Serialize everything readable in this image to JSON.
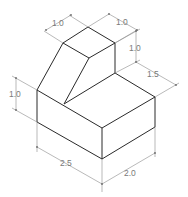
{
  "drawing": {
    "type": "isometric-dimensioned-part",
    "line_color": "#2a2a2a",
    "dimension_color": "#8a8a8a",
    "dimensions": [
      {
        "id": "top-left-depth",
        "label": "1.0"
      },
      {
        "id": "top-right-width",
        "label": "1.0"
      },
      {
        "id": "upper-step-height",
        "label": "1.0"
      },
      {
        "id": "step-depth",
        "label": "1.5"
      },
      {
        "id": "base-height",
        "label": "1.0"
      },
      {
        "id": "base-length",
        "label": "2.5"
      },
      {
        "id": "base-width",
        "label": "2.0"
      }
    ]
  }
}
